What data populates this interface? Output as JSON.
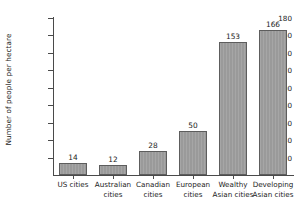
{
  "chart_data": {
    "type": "bar",
    "title": "",
    "xlabel": "",
    "ylabel": "Number of people per hectare",
    "categories": [
      "US cities",
      "Australian cities",
      "Canadian cities",
      "European cities",
      "Wealthy Asian cities",
      "Developing Asian cities"
    ],
    "values": [
      14,
      12,
      28,
      50,
      153,
      166
    ],
    "ylim": [
      0,
      180
    ],
    "yticks": [
      0,
      20,
      40,
      60,
      80,
      100,
      120,
      140,
      160,
      180
    ],
    "ytick_labels": [
      "0",
      "20",
      "40",
      "60",
      "80",
      "100",
      "120",
      "140",
      "160",
      "180"
    ],
    "grid": false,
    "legend": null,
    "bar_color": "#9a9a9a",
    "bar_edge_color": "#5d5d5d",
    "axis_color": "#4a4a4a",
    "text_color": "#1b1b1b",
    "background_color": "#ffffff",
    "value_labels_shown": true
  },
  "axis": {
    "y_title": "Number of people per hectare"
  },
  "categories_lines": [
    [
      "US cities"
    ],
    [
      "Australian",
      "cities"
    ],
    [
      "Canadian",
      "cities"
    ],
    [
      "European",
      "cities"
    ],
    [
      "Wealthy",
      "Asian cities"
    ],
    [
      "Developing",
      "Asian cities"
    ]
  ]
}
